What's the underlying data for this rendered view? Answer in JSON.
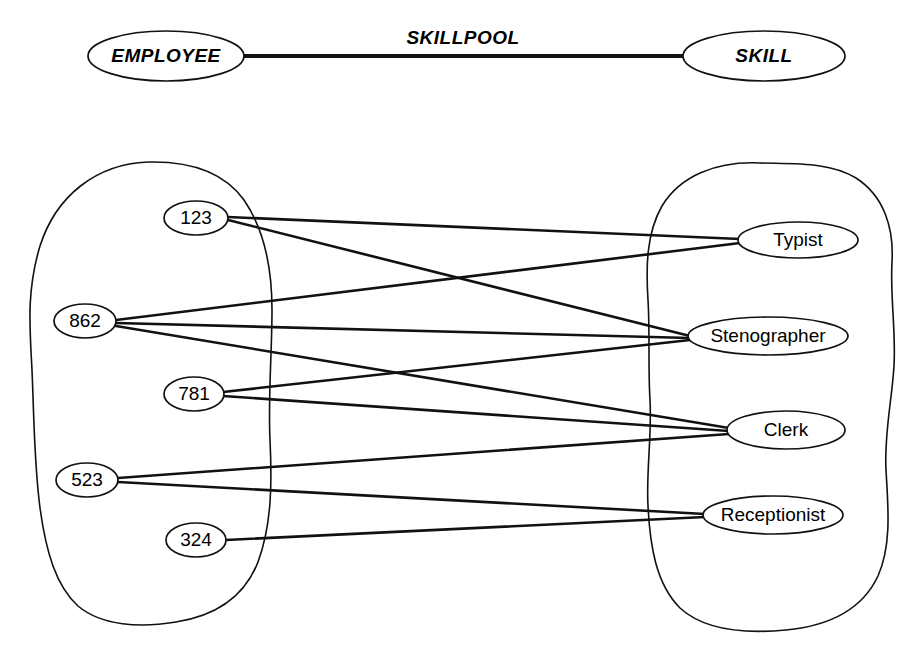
{
  "diagram": {
    "title": "SKILLPOOL",
    "schema": {
      "relationship_label": "SKILLPOOL",
      "left_entity": "EMPLOYEE",
      "right_entity": "SKILL"
    },
    "left_set": {
      "name": "employee-instance-set",
      "members": [
        {
          "id": "emp-123",
          "label": "123"
        },
        {
          "id": "emp-862",
          "label": "862"
        },
        {
          "id": "emp-781",
          "label": "781"
        },
        {
          "id": "emp-523",
          "label": "523"
        },
        {
          "id": "emp-324",
          "label": "324"
        }
      ]
    },
    "right_set": {
      "name": "skill-instance-set",
      "members": [
        {
          "id": "skill-typist",
          "label": "Typist"
        },
        {
          "id": "skill-stenographer",
          "label": "Stenographer"
        },
        {
          "id": "skill-clerk",
          "label": "Clerk"
        },
        {
          "id": "skill-receptionist",
          "label": "Receptionist"
        }
      ]
    },
    "edges": [
      {
        "from": "123",
        "to": "Typist"
      },
      {
        "from": "123",
        "to": "Stenographer"
      },
      {
        "from": "862",
        "to": "Typist"
      },
      {
        "from": "862",
        "to": "Stenographer"
      },
      {
        "from": "862",
        "to": "Clerk"
      },
      {
        "from": "781",
        "to": "Stenographer"
      },
      {
        "from": "781",
        "to": "Clerk"
      },
      {
        "from": "523",
        "to": "Clerk"
      },
      {
        "from": "523",
        "to": "Receptionist"
      },
      {
        "from": "324",
        "to": "Receptionist"
      }
    ],
    "colors": {
      "stroke": "#111111",
      "fill": "#ffffff",
      "text": "#000000"
    }
  }
}
